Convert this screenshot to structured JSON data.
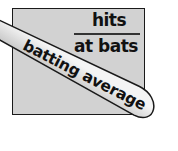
{
  "illustration": {
    "fraction": {
      "numerator": "hits",
      "denominator": "at bats"
    },
    "bat_label": "batting average",
    "colors": {
      "card_fill": "#d2d2d2",
      "outline": "#1a1a1a",
      "bat_light": "#f2f2f2",
      "bat_dark": "#a8a8a8",
      "text": "#111111"
    }
  }
}
